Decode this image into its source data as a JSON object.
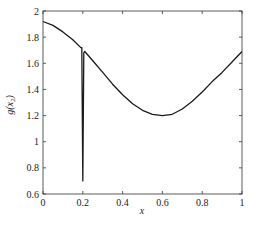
{
  "chart_data": {
    "type": "line",
    "title": "",
    "xlabel": "x",
    "ylabel": "g(x₂)",
    "xlim": [
      0,
      1
    ],
    "ylim": [
      0.6,
      2
    ],
    "grid": false,
    "legend": null,
    "x_ticks": [
      "0",
      "0.2",
      "0.4",
      "0.6",
      "0.8",
      "1"
    ],
    "y_ticks": [
      "0.6",
      "0.8",
      "1",
      "1.2",
      "1.4",
      "1.6",
      "1.8",
      "2"
    ],
    "series": [
      {
        "name": "g(x2)",
        "color": "#1a1a1a",
        "x": [
          0,
          0.05,
          0.1,
          0.15,
          0.19,
          0.195,
          0.2,
          0.205,
          0.21,
          0.25,
          0.3,
          0.35,
          0.4,
          0.45,
          0.5,
          0.55,
          0.6,
          0.65,
          0.7,
          0.75,
          0.8,
          0.85,
          0.9,
          0.95,
          1.0
        ],
        "y": [
          1.92,
          1.89,
          1.84,
          1.78,
          1.72,
          1.72,
          0.7,
          1.68,
          1.69,
          1.62,
          1.53,
          1.44,
          1.36,
          1.29,
          1.24,
          1.21,
          1.2,
          1.21,
          1.25,
          1.31,
          1.38,
          1.46,
          1.53,
          1.61,
          1.69
        ]
      }
    ]
  }
}
